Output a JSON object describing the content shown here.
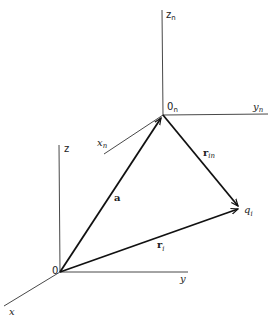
{
  "diagram": {
    "frames": [
      {
        "name": "global",
        "origin": {
          "label": "0",
          "x": 60,
          "y": 272
        },
        "axes": {
          "z": {
            "label": "z",
            "end": [
              59,
              145
            ]
          },
          "y": {
            "label": "y",
            "end": [
              188,
              272
            ]
          },
          "x": {
            "label": "x",
            "end": [
              4,
              306
            ]
          }
        }
      },
      {
        "name": "local",
        "origin": {
          "label": "0",
          "sub": "n",
          "x": 163,
          "y": 115
        },
        "axes": {
          "z": {
            "label": "z",
            "sub": "n",
            "end": [
              162,
              10
            ]
          },
          "y": {
            "label": "y",
            "sub": "n",
            "end": [
              268,
              114
            ]
          },
          "x": {
            "label": "x",
            "sub": "n",
            "end": [
              104,
              154
            ]
          }
        }
      }
    ],
    "point": {
      "label": "q",
      "sub": "i",
      "x": 240,
      "y": 208
    },
    "vectors": [
      {
        "label": "a",
        "from": "0",
        "to": "0_n"
      },
      {
        "label": "r",
        "sub": "i",
        "from": "0",
        "to": "q_i"
      },
      {
        "label": "r",
        "sub": "in",
        "from": "0_n",
        "to": "q_i"
      }
    ]
  },
  "labels": {
    "z": "z",
    "z_sub": "",
    "zn": "z",
    "zn_sub": "n",
    "yn": "y",
    "yn_sub": "n",
    "xn": "x",
    "xn_sub": "n",
    "on": "0",
    "on_sub": "n",
    "o": "0",
    "y": "y",
    "x": "x",
    "a": "a",
    "ri": "r",
    "ri_sub": "i",
    "rin": "r",
    "rin_sub": "in",
    "qi": "q",
    "qi_sub": "i"
  }
}
